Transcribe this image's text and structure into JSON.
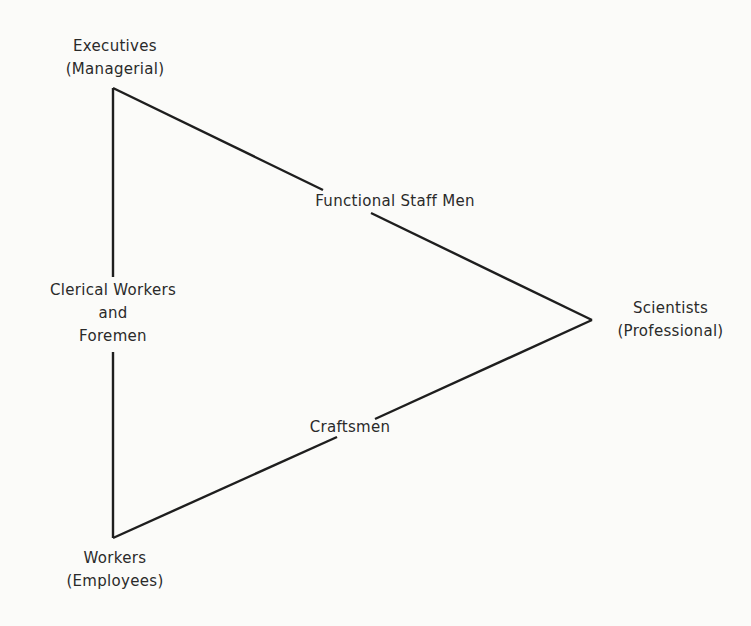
{
  "diagram": {
    "type": "triangle",
    "vertices": {
      "top": {
        "title": "Executives",
        "subtitle": "(Managerial)"
      },
      "right": {
        "title": "Scientists",
        "subtitle": "(Professional)"
      },
      "bottom": {
        "title": "Workers",
        "subtitle": "(Employees)"
      }
    },
    "edges": {
      "left": {
        "line1": "Clerical Workers",
        "line2": "and",
        "line3": "Foremen"
      },
      "upper": {
        "label": "Functional Staff Men"
      },
      "lower": {
        "label": "Craftsmen"
      }
    },
    "line_color": "#1e1e1e"
  }
}
